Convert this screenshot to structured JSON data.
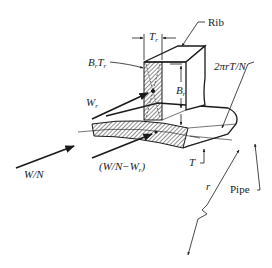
{
  "diagram": {
    "labels": {
      "rib": "Rib",
      "pipe": "Pipe",
      "tr_main": "T",
      "tr_sub": "r",
      "brtr_b": "B",
      "brtr_b_sub": "r",
      "brtr_t": "T",
      "brtr_t_sub": "r",
      "br_main": "B",
      "br_sub": "r",
      "wr_main": "W",
      "wr_sub": "r",
      "wn": "W/N",
      "wn_minus_wr_pre": "(W/N−W",
      "wn_minus_wr_sub": "r",
      "wn_minus_wr_post": ")",
      "t_thickness": "T",
      "arc": "2πrT/N",
      "radius": "r"
    },
    "colors": {
      "line": "#1a1a1a",
      "hatch": "#555555",
      "background": "#ffffff"
    }
  }
}
